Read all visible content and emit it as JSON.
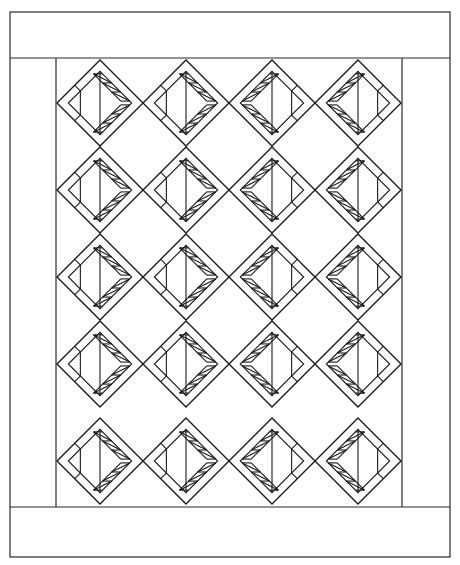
{
  "figure": {
    "type": "quilt-pattern-line-drawing",
    "stroke_color": "#1a1a1a",
    "background": "#ffffff"
  },
  "frame": {
    "outer": {
      "x1": 10,
      "y1": 12,
      "x2": 450,
      "y2": 557
    },
    "top_border_line_y": 58,
    "bottom_border_line_y": 507,
    "left_border_line_x": 56,
    "right_border_line_x": 402
  },
  "grid": {
    "columns": 4,
    "rows": 5,
    "column_centers_x": [
      100,
      186,
      272,
      358
    ],
    "row_top_y": [
      60,
      147,
      234,
      321,
      418
    ],
    "half_diagonal": 43,
    "column_orientation": [
      "right",
      "right",
      "left",
      "left"
    ],
    "strip_width": 8,
    "sawtooth_triangles_per_edge": 3
  }
}
